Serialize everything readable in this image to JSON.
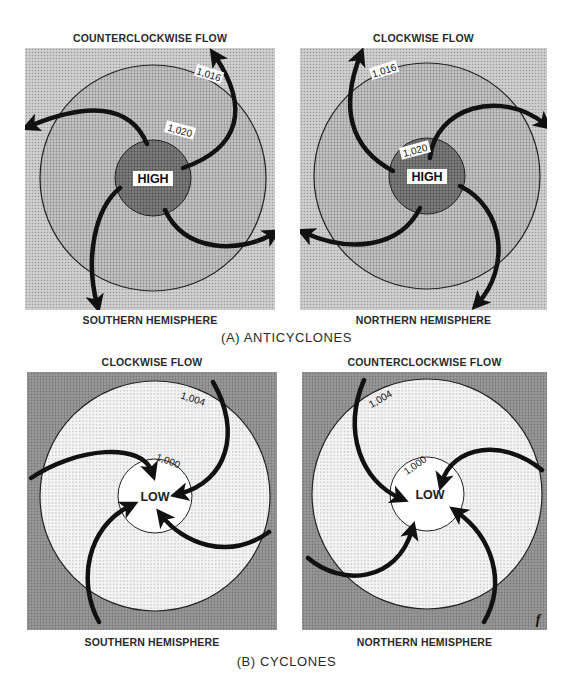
{
  "figure": {
    "section_a": {
      "title": "(A) ANTICYCLONES",
      "left": {
        "flow_label": "COUNTERCLOCKWISE FLOW",
        "hemisphere_label": "SOUTHERN HEMISPHERE",
        "center_label": "HIGH",
        "inner_isobar": "1,020",
        "outer_isobar": "1,016"
      },
      "right": {
        "flow_label": "CLOCKWISE FLOW",
        "hemisphere_label": "NORTHERN HEMISPHERE",
        "center_label": "HIGH",
        "inner_isobar": "1,020",
        "outer_isobar": "1,016"
      }
    },
    "section_b": {
      "title": "(B) CYCLONES",
      "left": {
        "flow_label": "CLOCKWISE FLOW",
        "hemisphere_label": "SOUTHERN HEMISPHERE",
        "center_label": "LOW",
        "inner_isobar": "1,000",
        "outer_isobar": "1,004"
      },
      "right": {
        "flow_label": "COUNTERCLOCKWISE FLOW",
        "hemisphere_label": "NORTHERN HEMISPHERE",
        "center_label": "LOW",
        "inner_isobar": "1,000",
        "outer_isobar": "1,004",
        "corner_mark": "f"
      }
    },
    "colors": {
      "anticyclone_background": "#c8c8c8",
      "anticyclone_outer_ring": "#bdbdbd",
      "anticyclone_center": "#7a7a7a",
      "cyclone_background": "#8f8f8f",
      "cyclone_outer_ring": "#ececec",
      "cyclone_center": "#ffffff",
      "arrow": "#111111"
    }
  }
}
